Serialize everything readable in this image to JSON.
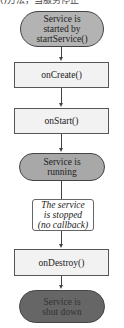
{
  "header_fragment": "()方法，当服务停止",
  "colors": {
    "start_fill": "#b3b3b3",
    "running_fill": "#a8a8a8",
    "shutdown_fill": "#666666",
    "callback_fill": "#f2f2f2",
    "note_fill": "#ffffff"
  },
  "nodes": [
    {
      "id": "start",
      "shape": "stadium",
      "label": "Service is\nstarted by\nstartService()"
    },
    {
      "id": "onCreate",
      "shape": "rect",
      "label": "onCreate()"
    },
    {
      "id": "onStart",
      "shape": "rect",
      "label": "onStart()"
    },
    {
      "id": "running",
      "shape": "stadium",
      "label": "Service is\nrunning"
    },
    {
      "id": "stopped",
      "shape": "note",
      "label": "The service\nis stopped\n(no callback)"
    },
    {
      "id": "onDestroy",
      "shape": "rect",
      "label": "onDestroy()"
    },
    {
      "id": "shutdown",
      "shape": "stadium",
      "label": "Service is\nshut down"
    }
  ],
  "edges": [
    {
      "from": "start",
      "to": "onCreate"
    },
    {
      "from": "onCreate",
      "to": "onStart"
    },
    {
      "from": "onStart",
      "to": "running"
    },
    {
      "from": "running",
      "to": "stopped"
    },
    {
      "from": "stopped",
      "to": "onDestroy"
    },
    {
      "from": "onDestroy",
      "to": "shutdown"
    }
  ]
}
